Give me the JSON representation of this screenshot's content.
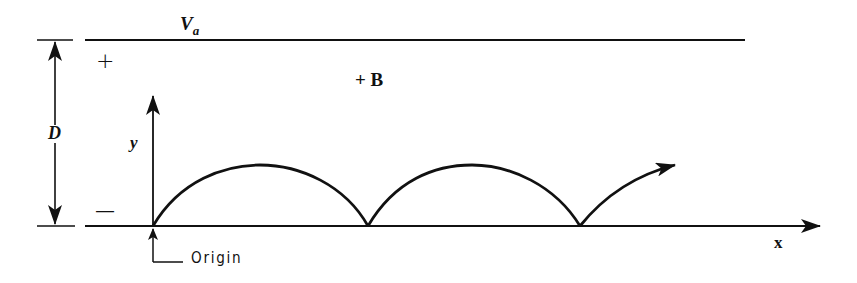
{
  "diagram": {
    "labels": {
      "anode_voltage": "V",
      "anode_voltage_sub": "a",
      "plate_plus": "+",
      "plate_minus": "—",
      "magnetic_field": "+ B",
      "separation": "D",
      "y_axis": "y",
      "x_axis": "x",
      "origin": "Origin"
    },
    "colors": {
      "ink": "#111111",
      "background": "#ffffff"
    },
    "geometry": {
      "top_plate_y": 40,
      "bottom_plate_y": 226,
      "origin_x": 153,
      "cusps_x": [
        153,
        368,
        580
      ],
      "arc_peak_y": 165
    }
  }
}
